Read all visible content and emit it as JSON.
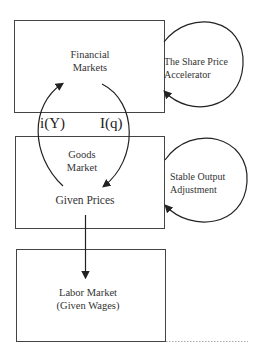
{
  "boxes": {
    "financial": {
      "line1": "Financial",
      "line2": "Markets"
    },
    "goods": {
      "line1": "Goods",
      "line2": "Market",
      "line3": "Given Prices"
    },
    "labor": {
      "line1": "Labor Market",
      "line2": "(Given Wages)"
    }
  },
  "loops": {
    "share_price": {
      "line1": "The Share Price",
      "line2": "Accelerator"
    },
    "stable_output": {
      "line1": "Stable Output",
      "line2": "Adjustment"
    }
  },
  "symbols": {
    "left": "i(Y)",
    "right": "I(q)"
  },
  "colors": {
    "stroke": "#333333",
    "dotted": "#aaaaaa"
  }
}
